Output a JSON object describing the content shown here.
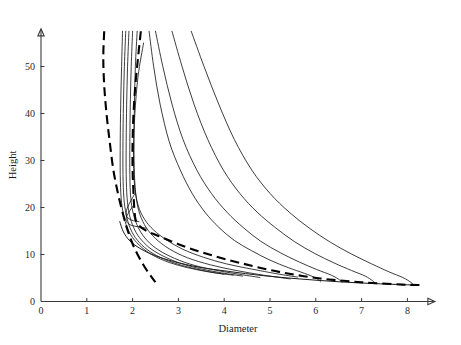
{
  "chart_data": {
    "type": "line",
    "title": "",
    "xlabel": "Diameter",
    "ylabel": "Height",
    "xlim": [
      0,
      8.6
    ],
    "ylim": [
      0,
      58
    ],
    "xticks": [
      0,
      1,
      2,
      3,
      4,
      5,
      6,
      7,
      8
    ],
    "yticks": [
      0,
      10,
      20,
      30,
      40,
      50
    ],
    "xtick_labels": [
      "0",
      "1",
      "2",
      "3",
      "4",
      "5",
      "6",
      "7",
      "8"
    ],
    "ytick_labels": [
      "0",
      "10",
      "20",
      "30",
      "40",
      "50"
    ],
    "grid": false,
    "legend": "none",
    "axis_style": "arrow-ended half-frame",
    "series": [
      {
        "name": "trajectory-1",
        "style": "solid",
        "points": [
          [
            1.78,
            57.5
          ],
          [
            1.76,
            50.0
          ],
          [
            1.74,
            42.0
          ],
          [
            1.73,
            34.0
          ],
          [
            1.73,
            27.0
          ],
          [
            1.75,
            22.0
          ],
          [
            1.8,
            18.5
          ],
          [
            1.88,
            15.8
          ],
          [
            2.0,
            13.6
          ],
          [
            2.2,
            11.5
          ],
          [
            2.45,
            9.8
          ],
          [
            2.8,
            8.3
          ],
          [
            3.2,
            7.2
          ],
          [
            3.6,
            6.4
          ],
          [
            4.0,
            5.8
          ]
        ]
      },
      {
        "name": "trajectory-2",
        "style": "solid",
        "points": [
          [
            1.85,
            57.5
          ],
          [
            1.82,
            50.0
          ],
          [
            1.8,
            42.0
          ],
          [
            1.79,
            34.0
          ],
          [
            1.79,
            27.0
          ],
          [
            1.81,
            22.0
          ],
          [
            1.86,
            18.5
          ],
          [
            1.94,
            15.8
          ],
          [
            2.06,
            13.6
          ],
          [
            2.26,
            11.5
          ],
          [
            2.52,
            9.8
          ],
          [
            2.88,
            8.3
          ],
          [
            3.3,
            7.1
          ],
          [
            3.75,
            6.2
          ],
          [
            4.2,
            5.6
          ]
        ]
      },
      {
        "name": "trajectory-3",
        "style": "solid",
        "points": [
          [
            1.92,
            57.5
          ],
          [
            1.89,
            50.0
          ],
          [
            1.87,
            42.0
          ],
          [
            1.86,
            34.0
          ],
          [
            1.86,
            27.0
          ],
          [
            1.88,
            22.0
          ],
          [
            1.93,
            18.5
          ],
          [
            2.02,
            15.8
          ],
          [
            2.15,
            13.6
          ],
          [
            2.36,
            11.5
          ],
          [
            2.64,
            9.8
          ],
          [
            3.02,
            8.2
          ],
          [
            3.46,
            7.0
          ],
          [
            3.94,
            6.1
          ],
          [
            4.4,
            5.4
          ]
        ]
      },
      {
        "name": "trajectory-4",
        "style": "solid",
        "points": [
          [
            2.0,
            57.5
          ],
          [
            1.97,
            50.0
          ],
          [
            1.95,
            42.0
          ],
          [
            1.94,
            34.0
          ],
          [
            1.94,
            27.0
          ],
          [
            1.96,
            22.0
          ],
          [
            2.02,
            18.5
          ],
          [
            2.12,
            15.8
          ],
          [
            2.27,
            13.5
          ],
          [
            2.5,
            11.4
          ],
          [
            2.82,
            9.6
          ],
          [
            3.24,
            8.0
          ],
          [
            3.74,
            6.8
          ],
          [
            4.26,
            5.9
          ],
          [
            4.78,
            5.1
          ]
        ]
      },
      {
        "name": "trajectory-5",
        "style": "solid",
        "points": [
          [
            2.1,
            57.5
          ],
          [
            2.06,
            50.0
          ],
          [
            2.04,
            42.0
          ],
          [
            2.03,
            34.0
          ],
          [
            2.04,
            27.0
          ],
          [
            2.08,
            22.0
          ],
          [
            2.16,
            18.5
          ],
          [
            2.3,
            15.7
          ],
          [
            2.5,
            13.4
          ],
          [
            2.8,
            11.2
          ],
          [
            3.2,
            9.3
          ],
          [
            3.7,
            7.8
          ],
          [
            4.26,
            6.6
          ],
          [
            4.86,
            5.6
          ],
          [
            5.44,
            4.8
          ]
        ]
      },
      {
        "name": "trajectory-6",
        "style": "solid",
        "points": [
          [
            2.24,
            55.0
          ],
          [
            2.12,
            48.0
          ],
          [
            2.05,
            40.0
          ],
          [
            2.02,
            32.0
          ],
          [
            2.04,
            25.0
          ],
          [
            2.12,
            20.5
          ],
          [
            2.26,
            17.5
          ],
          [
            2.46,
            15.2
          ],
          [
            2.74,
            13.1
          ],
          [
            3.1,
            11.1
          ],
          [
            3.55,
            9.4
          ],
          [
            4.05,
            8.0
          ],
          [
            4.6,
            6.9
          ],
          [
            5.15,
            5.9
          ],
          [
            5.6,
            5.2
          ]
        ]
      },
      {
        "name": "trajectory-7",
        "style": "solid",
        "points": [
          [
            2.36,
            57.5
          ],
          [
            2.46,
            50.0
          ],
          [
            2.6,
            42.0
          ],
          [
            2.8,
            34.0
          ],
          [
            3.04,
            28.0
          ],
          [
            3.3,
            23.0
          ],
          [
            3.58,
            19.0
          ],
          [
            3.88,
            15.8
          ],
          [
            4.22,
            13.0
          ],
          [
            4.6,
            10.8
          ],
          [
            5.0,
            8.8
          ],
          [
            5.4,
            7.2
          ],
          [
            5.75,
            6.0
          ],
          [
            6.0,
            5.0
          ],
          [
            6.1,
            4.2
          ]
        ]
      },
      {
        "name": "trajectory-8",
        "style": "solid",
        "points": [
          [
            2.5,
            57.5
          ],
          [
            2.66,
            50.0
          ],
          [
            2.86,
            42.0
          ],
          [
            3.1,
            34.5
          ],
          [
            3.4,
            28.0
          ],
          [
            3.72,
            23.0
          ],
          [
            4.06,
            19.0
          ],
          [
            4.42,
            15.7
          ],
          [
            4.8,
            12.8
          ],
          [
            5.22,
            10.4
          ],
          [
            5.64,
            8.4
          ],
          [
            6.02,
            6.8
          ],
          [
            6.34,
            5.6
          ],
          [
            6.52,
            4.6
          ],
          [
            6.58,
            4.0
          ]
        ]
      },
      {
        "name": "trajectory-9",
        "style": "solid",
        "points": [
          [
            2.86,
            57.5
          ],
          [
            3.08,
            50.0
          ],
          [
            3.34,
            42.0
          ],
          [
            3.64,
            34.5
          ],
          [
            3.98,
            28.0
          ],
          [
            4.34,
            23.0
          ],
          [
            4.72,
            19.0
          ],
          [
            5.12,
            15.7
          ],
          [
            5.54,
            12.7
          ],
          [
            5.98,
            10.2
          ],
          [
            6.4,
            8.2
          ],
          [
            6.78,
            6.6
          ],
          [
            7.08,
            5.4
          ],
          [
            7.24,
            4.4
          ],
          [
            7.3,
            3.9
          ]
        ]
      },
      {
        "name": "trajectory-10",
        "style": "solid",
        "points": [
          [
            3.28,
            57.5
          ],
          [
            3.56,
            50.0
          ],
          [
            3.88,
            42.0
          ],
          [
            4.22,
            34.5
          ],
          [
            4.6,
            28.0
          ],
          [
            5.0,
            23.0
          ],
          [
            5.42,
            19.0
          ],
          [
            5.86,
            15.6
          ],
          [
            6.32,
            12.6
          ],
          [
            6.78,
            10.1
          ],
          [
            7.22,
            8.0
          ],
          [
            7.6,
            6.3
          ],
          [
            7.9,
            5.1
          ],
          [
            8.06,
            4.2
          ],
          [
            8.12,
            3.7
          ]
        ]
      },
      {
        "name": "inner-loop-1",
        "style": "solid",
        "points": [
          [
            2.04,
            22.8
          ],
          [
            1.96,
            21.4
          ],
          [
            1.88,
            19.8
          ],
          [
            1.86,
            18.4
          ],
          [
            1.92,
            17.6
          ],
          [
            2.02,
            17.2
          ],
          [
            2.14,
            17.0
          ]
        ]
      },
      {
        "name": "inner-loop-2",
        "style": "solid",
        "points": [
          [
            2.0,
            20.2
          ],
          [
            1.92,
            19.0
          ],
          [
            1.86,
            17.8
          ],
          [
            1.88,
            16.8
          ],
          [
            1.98,
            16.2
          ],
          [
            2.12,
            15.9
          ],
          [
            2.3,
            15.6
          ]
        ]
      },
      {
        "name": "lower-envelope",
        "style": "solid",
        "points": [
          [
            1.72,
            17.0
          ],
          [
            1.8,
            14.8
          ],
          [
            1.94,
            12.9
          ],
          [
            2.16,
            11.3
          ],
          [
            2.48,
            9.8
          ],
          [
            2.9,
            8.5
          ],
          [
            3.45,
            7.3
          ],
          [
            4.1,
            6.4
          ],
          [
            4.85,
            5.5
          ],
          [
            5.65,
            4.8
          ],
          [
            6.5,
            4.2
          ],
          [
            7.3,
            3.8
          ],
          [
            8.15,
            3.5
          ]
        ]
      },
      {
        "name": "left-boundary-dashed",
        "style": "dashed",
        "points": [
          [
            1.38,
            57.5
          ],
          [
            1.36,
            52.0
          ],
          [
            1.38,
            46.0
          ],
          [
            1.43,
            40.0
          ],
          [
            1.5,
            34.0
          ],
          [
            1.58,
            28.0
          ],
          [
            1.68,
            23.0
          ],
          [
            1.78,
            19.0
          ],
          [
            1.88,
            15.5
          ],
          [
            1.99,
            12.5
          ],
          [
            2.12,
            9.8
          ],
          [
            2.26,
            7.4
          ],
          [
            2.4,
            5.4
          ],
          [
            2.5,
            4.1
          ]
        ]
      },
      {
        "name": "inner-boundary-dashed",
        "style": "dashed",
        "points": [
          [
            2.18,
            57.5
          ],
          [
            2.12,
            52.0
          ],
          [
            2.06,
            46.0
          ],
          [
            2.02,
            40.0
          ],
          [
            2.0,
            34.0
          ],
          [
            2.0,
            28.0
          ],
          [
            2.02,
            23.0
          ],
          [
            2.04,
            19.5
          ],
          [
            2.08,
            17.0
          ],
          [
            2.24,
            15.4
          ],
          [
            2.55,
            14.0
          ],
          [
            3.0,
            12.2
          ],
          [
            3.6,
            10.2
          ],
          [
            4.35,
            8.2
          ],
          [
            5.2,
            6.3
          ],
          [
            6.1,
            4.9
          ],
          [
            7.0,
            4.1
          ],
          [
            7.9,
            3.6
          ],
          [
            8.3,
            3.5
          ]
        ]
      }
    ]
  }
}
